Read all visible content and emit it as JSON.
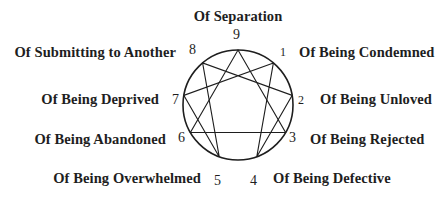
{
  "diagram": {
    "type": "enneagram",
    "center": {
      "x": 238,
      "y": 105
    },
    "radius": 55,
    "stroke_color": "#1e1e1e",
    "text_color": "#1e1e1e",
    "points": [
      {
        "number": "9",
        "label": "Of Separation"
      },
      {
        "number": "1",
        "label": "Of Being Condemned"
      },
      {
        "number": "2",
        "label": "Of Being Unloved"
      },
      {
        "number": "3",
        "label": "Of Being Rejected"
      },
      {
        "number": "4",
        "label": "Of Being Defective"
      },
      {
        "number": "5",
        "label": "Of Being Overwhelmed"
      },
      {
        "number": "6",
        "label": "Of Being Abandoned"
      },
      {
        "number": "7",
        "label": "Of Being Deprived"
      },
      {
        "number": "8",
        "label": "Of Submitting to Another"
      }
    ],
    "connections": {
      "triangle": [
        "9",
        "3",
        "6",
        "9"
      ],
      "hexad": [
        "1",
        "4",
        "2",
        "8",
        "5",
        "7",
        "1"
      ]
    }
  }
}
